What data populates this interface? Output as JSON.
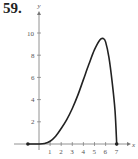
{
  "problem": {
    "number": "59."
  },
  "chart_data": {
    "type": "line",
    "title": "",
    "xlabel": "x",
    "ylabel": "y",
    "xlim": [
      -1,
      8
    ],
    "ylim": [
      0,
      12
    ],
    "x_ticks": [
      "1",
      "2",
      "3",
      "4",
      "5",
      "6",
      "7"
    ],
    "y_ticks": [
      "2",
      "4",
      "6",
      "8",
      "10"
    ],
    "grid": false,
    "legend": null,
    "series": [
      {
        "name": "f(x)",
        "x": [
          -1,
          0,
          0.5,
          1,
          1.5,
          2,
          2.5,
          3,
          3.5,
          4,
          4.5,
          5,
          5.5,
          5.8,
          6,
          6.3,
          6.6,
          6.85,
          7
        ],
        "y": [
          0,
          0,
          0.05,
          0.25,
          0.7,
          1.4,
          2.2,
          3.2,
          4.4,
          5.8,
          7.2,
          8.5,
          9.4,
          9.5,
          9.2,
          7.8,
          5.5,
          3.0,
          0
        ]
      }
    ],
    "points": [
      {
        "x": -1,
        "y": 0,
        "style": "filled-dot"
      },
      {
        "x": 7,
        "y": 0,
        "style": "filled-dot"
      }
    ]
  },
  "colors": {
    "curve": "#222222",
    "axis": "#777777",
    "text": "#555555"
  }
}
